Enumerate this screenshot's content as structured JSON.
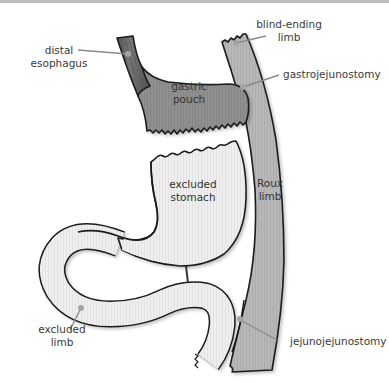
{
  "diagram": {
    "colors": {
      "outline": "#1a1a1a",
      "esophagus_fill": "#6e6e6e",
      "pouch_fill": "#8c8c8c",
      "roux_limb_fill": "#b4b4b4",
      "stomach_fill": "#ececec",
      "leader_line": "#8a8a8a",
      "leader_dot": "#a0a0a0",
      "text": "#3a3a3a",
      "top_border": "#bdbdbd"
    },
    "structures": {
      "gastric_pouch": {
        "line1": "gastric",
        "line2": "pouch"
      },
      "excluded_stomach": {
        "line1": "excluded",
        "line2": "stomach"
      },
      "roux_limb": {
        "line1": "Roux",
        "line2": "limb"
      }
    },
    "callouts": {
      "distal_esophagus": {
        "line1": "distal",
        "line2": "esophagus"
      },
      "blind_ending_limb": {
        "line1": "blind-ending",
        "line2": "limb"
      },
      "gastrojejunostomy": {
        "line1": "gastrojejunostomy"
      },
      "excluded_limb": {
        "line1": "excluded",
        "line2": "limb"
      },
      "jejunojejunostomy": {
        "line1": "jejunojejunostomy"
      }
    }
  }
}
